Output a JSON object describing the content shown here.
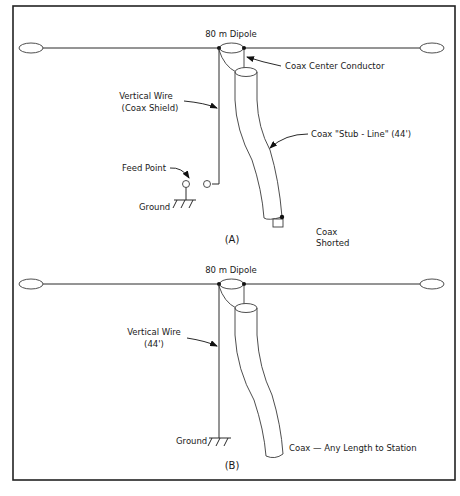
{
  "figure": {
    "panels": [
      {
        "id": "A",
        "caption": "(A)",
        "dipole_label": "80 m Dipole",
        "labels": {
          "center_conductor": "Coax Center Conductor",
          "vertical_wire_line1": "Vertical Wire",
          "vertical_wire_line2": "(Coax Shield)",
          "stub_line": "Coax \"Stub - Line\" (44')",
          "feed_point": "Feed Point",
          "ground": "Ground",
          "shorted_line1": "Coax",
          "shorted_line2": "Shorted"
        }
      },
      {
        "id": "B",
        "caption": "(B)",
        "dipole_label": "80 m Dipole",
        "labels": {
          "vertical_wire_line1": "Vertical Wire",
          "vertical_wire_line2": "(44')",
          "ground": "Ground",
          "coax_to_station": "Coax — Any Length to Station"
        }
      }
    ],
    "colors": {
      "line": "#2a2a2a",
      "frame": "#222222",
      "background": "#ffffff"
    }
  }
}
